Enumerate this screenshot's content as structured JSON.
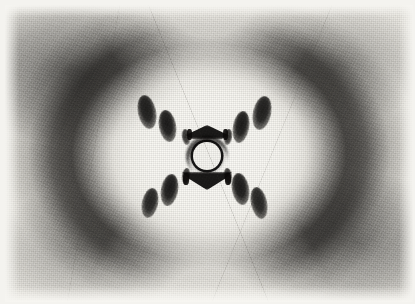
{
  "image": {
    "kind": "x-ray-diffraction-photograph",
    "subject_label": "Photo 51 — B-form DNA fibre X-ray diffraction",
    "width_px": 415,
    "height_px": 304,
    "border": {
      "color": "#f4f3ef",
      "left_px": 5,
      "top_px": 5,
      "right_px": 4,
      "bottom_px": 4
    },
    "palette": {
      "paper": "#f4f3ef",
      "film_base": "#e9e7e1",
      "bright_core": "#fbfaf6",
      "halo_dark": "#0e0c0a",
      "spot_dark": "#080706",
      "beamstop_fill": "#f7f6f1",
      "beamstop_ring": "#080706"
    }
  },
  "pattern": {
    "center": {
      "x": 207,
      "y": 156
    },
    "beamstop": {
      "cx": 207,
      "cy": 156,
      "radius_px": 14,
      "ring_width_px": 3
    },
    "halo": {
      "description": "outer diffuse scattering ring, densest left and right, open at top and bottom",
      "rx_px": 208,
      "ry_px": 168
    },
    "bright_core": {
      "rx_px": 150,
      "ry_px": 128
    },
    "arms": [
      {
        "name": "upper-left",
        "angle_deg": 145
      },
      {
        "name": "upper-right",
        "angle_deg": 35
      },
      {
        "name": "lower-left",
        "angle_deg": 215
      },
      {
        "name": "lower-right",
        "angle_deg": 325
      }
    ],
    "spots": [
      {
        "id": "UL-4",
        "arm": "upper-left",
        "layer_line": 4,
        "cx": 147,
        "cy": 112,
        "rx": 9,
        "ry": 17,
        "rot_deg": -12,
        "intensity": 0.93
      },
      {
        "id": "UL-3",
        "arm": "upper-left",
        "layer_line": 3,
        "cx": 167,
        "cy": 126,
        "rx": 8.5,
        "ry": 16,
        "rot_deg": -10,
        "intensity": 0.95
      },
      {
        "id": "UL-2",
        "arm": "upper-left",
        "layer_line": 2,
        "cx": 186,
        "cy": 137,
        "rx": 4,
        "ry": 8,
        "rot_deg": -8,
        "intensity": 0.88
      },
      {
        "id": "UR-2",
        "arm": "upper-right",
        "layer_line": 2,
        "cx": 228,
        "cy": 137,
        "rx": 4,
        "ry": 8,
        "rot_deg": 8,
        "intensity": 0.88
      },
      {
        "id": "UR-3",
        "arm": "upper-right",
        "layer_line": 3,
        "cx": 241,
        "cy": 127,
        "rx": 8,
        "ry": 16,
        "rot_deg": 10,
        "intensity": 0.95
      },
      {
        "id": "UR-4",
        "arm": "upper-right",
        "layer_line": 4,
        "cx": 262,
        "cy": 113,
        "rx": 9,
        "ry": 17,
        "rot_deg": 12,
        "intensity": 0.93
      },
      {
        "id": "LL-2",
        "arm": "lower-left",
        "layer_line": 2,
        "cx": 186,
        "cy": 176,
        "rx": 4,
        "ry": 8,
        "rot_deg": 8,
        "intensity": 0.88
      },
      {
        "id": "LL-3",
        "arm": "lower-left",
        "layer_line": 3,
        "cx": 169,
        "cy": 190,
        "rx": 8.5,
        "ry": 16,
        "rot_deg": 10,
        "intensity": 0.95
      },
      {
        "id": "LL-4",
        "arm": "lower-left",
        "layer_line": 4,
        "cx": 150,
        "cy": 203,
        "rx": 8,
        "ry": 15,
        "rot_deg": 12,
        "intensity": 0.9
      },
      {
        "id": "LR-2",
        "arm": "lower-right",
        "layer_line": 2,
        "cx": 228,
        "cy": 176,
        "rx": 4,
        "ry": 8,
        "rot_deg": -8,
        "intensity": 0.88
      },
      {
        "id": "LR-3",
        "arm": "lower-right",
        "layer_line": 3,
        "cx": 240,
        "cy": 189,
        "rx": 8.5,
        "ry": 16,
        "rot_deg": -10,
        "intensity": 0.95
      },
      {
        "id": "LR-4",
        "arm": "lower-right",
        "layer_line": 4,
        "cx": 259,
        "cy": 203,
        "rx": 8,
        "ry": 16,
        "rot_deg": -12,
        "intensity": 0.9
      }
    ],
    "meridional_arcs": [
      {
        "id": "arc-top",
        "position": "above-beamstop",
        "cx": 207,
        "cy": 132,
        "width": 42,
        "height": 14
      },
      {
        "id": "arc-bottom",
        "position": "below-beamstop",
        "cx": 207,
        "cy": 181,
        "width": 50,
        "height": 18
      }
    ],
    "meridional_ticks": [
      {
        "id": "tick-top-left",
        "cx": 189,
        "cy": 134,
        "w": 5,
        "h": 11
      },
      {
        "id": "tick-top-right",
        "cx": 225,
        "cy": 134,
        "w": 5,
        "h": 11
      },
      {
        "id": "tick-bottom-left",
        "cx": 186,
        "cy": 179,
        "w": 6,
        "h": 12
      },
      {
        "id": "tick-bottom-right",
        "cx": 228,
        "cy": 179,
        "w": 6,
        "h": 12
      }
    ]
  },
  "features": {
    "grain": "heavy silver-halide film grain",
    "scratches": "faint diagonal emulsion scratches in light regions",
    "missing_layer_line": "fourth layer line absent on the meridian"
  }
}
